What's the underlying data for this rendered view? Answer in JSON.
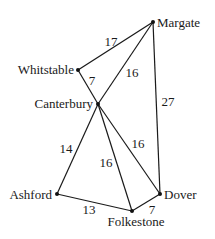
{
  "graph": {
    "nodes": [
      {
        "id": "margate",
        "label": "Margate",
        "x": 153,
        "y": 22,
        "lx": 157,
        "ly": 27,
        "anchor": "start"
      },
      {
        "id": "whitstable",
        "label": "Whitstable",
        "x": 78,
        "y": 70,
        "lx": 74,
        "ly": 74,
        "anchor": "end"
      },
      {
        "id": "canterbury",
        "label": "Canterbury",
        "x": 98,
        "y": 104,
        "lx": 93,
        "ly": 108,
        "anchor": "end"
      },
      {
        "id": "ashford",
        "label": "Ashford",
        "x": 57,
        "y": 194,
        "lx": 52,
        "ly": 199,
        "anchor": "end"
      },
      {
        "id": "folkestone",
        "label": "Folkestone",
        "x": 132,
        "y": 211,
        "lx": 136,
        "ly": 226,
        "anchor": "middle"
      },
      {
        "id": "dover",
        "label": "Dover",
        "x": 160,
        "y": 194,
        "lx": 164,
        "ly": 199,
        "anchor": "start"
      }
    ],
    "edges": [
      {
        "from": "margate",
        "to": "whitstable",
        "weight": "17",
        "wx": 111,
        "wy": 46
      },
      {
        "from": "margate",
        "to": "canterbury",
        "weight": "16",
        "wx": 132,
        "wy": 77
      },
      {
        "from": "margate",
        "to": "dover",
        "weight": "27",
        "wx": 168,
        "wy": 106
      },
      {
        "from": "whitstable",
        "to": "canterbury",
        "weight": "7",
        "wx": 92,
        "wy": 85
      },
      {
        "from": "canterbury",
        "to": "ashford",
        "weight": "14",
        "wx": 66,
        "wy": 153
      },
      {
        "from": "canterbury",
        "to": "folkestone",
        "weight": "16",
        "wx": 106,
        "wy": 167
      },
      {
        "from": "canterbury",
        "to": "dover",
        "weight": "16",
        "wx": 138,
        "wy": 148
      },
      {
        "from": "ashford",
        "to": "folkestone",
        "weight": "13",
        "wx": 89,
        "wy": 214
      },
      {
        "from": "folkestone",
        "to": "dover",
        "weight": "7",
        "wx": 152,
        "wy": 214
      }
    ]
  }
}
